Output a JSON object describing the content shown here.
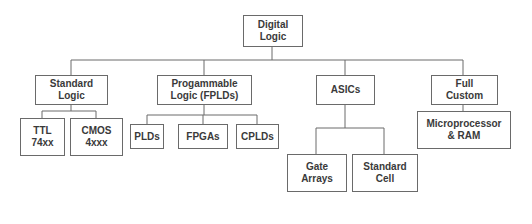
{
  "diagram": {
    "root": {
      "label": "Digital\nLogic"
    },
    "categories": [
      {
        "label": "Standard\nLogic",
        "children": [
          {
            "label": "TTL\n74xx"
          },
          {
            "label": "CMOS\n4xxx"
          }
        ]
      },
      {
        "label": "Progammable\nLogic (FPLDs)",
        "children": [
          {
            "label": "PLDs"
          },
          {
            "label": "FPGAs"
          },
          {
            "label": "CPLDs"
          }
        ]
      },
      {
        "label": "ASICs",
        "children": [
          {
            "label": "Gate\nArrays"
          },
          {
            "label": "Standard\nCell"
          }
        ]
      },
      {
        "label": "Full\nCustom",
        "children": [
          {
            "label": "Microprocessor\n& RAM"
          }
        ]
      }
    ],
    "colors": {
      "line": "#6a6a6a",
      "text": "#3a3a3a",
      "background": "#ffffff"
    }
  }
}
